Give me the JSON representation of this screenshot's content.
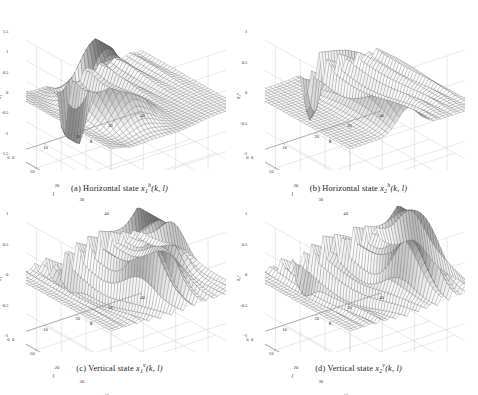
{
  "figure": {
    "title_visible": false,
    "background": "#ffffff",
    "layout": "2x2 grid of 3D mesh surface plots",
    "mesh_color": "#4a4a4a",
    "grid_color": "#c8c8c8",
    "axis_color": "#808080"
  },
  "panels": [
    {
      "id": "a",
      "caption_prefix": "(a)",
      "caption_text": "Horizontal state",
      "var_base": "x",
      "var_sub": "1",
      "var_sup": "h",
      "var_args": "(k, l)",
      "zlabel": "x₁ʰ",
      "zticks": [
        "1.5",
        "1",
        "0.5",
        "0",
        "-0.5",
        "-1",
        "-1.5"
      ],
      "kticks": [
        "0",
        "10",
        "20",
        "30",
        "40"
      ],
      "lticks": [
        "0",
        "10",
        "20",
        "30",
        "40"
      ],
      "klabel": "k",
      "llabel": "l"
    },
    {
      "id": "b",
      "caption_prefix": "(b)",
      "caption_text": "Horizontal state",
      "var_base": "x",
      "var_sub": "2",
      "var_sup": "h",
      "var_args": "(k, l)",
      "zlabel": "x₂ʰ",
      "zticks": [
        "1",
        "0.5",
        "0",
        "-0.5",
        "-1"
      ],
      "kticks": [
        "0",
        "10",
        "20",
        "30",
        "40"
      ],
      "lticks": [
        "0",
        "10",
        "20",
        "30",
        "40"
      ],
      "klabel": "k",
      "llabel": "l"
    },
    {
      "id": "c",
      "caption_prefix": "(c)",
      "caption_text": "Vertical state",
      "var_base": "x",
      "var_sub": "1",
      "var_sup": "v",
      "var_args": "(k, l)",
      "zlabel": "x₁ᵛ",
      "zticks": [
        "1",
        "0.5",
        "0",
        "-0.5",
        "-1"
      ],
      "kticks": [
        "0",
        "10",
        "20",
        "30",
        "40"
      ],
      "lticks": [
        "0",
        "10",
        "20",
        "30",
        "40"
      ],
      "klabel": "k",
      "llabel": "l"
    },
    {
      "id": "d",
      "caption_prefix": "(d)",
      "caption_text": "Vertical state",
      "var_base": "x",
      "var_sub": "2",
      "var_sup": "v",
      "var_args": "(k, l)",
      "zlabel": "x₂ᵛ",
      "zticks": [
        "1",
        "0.5",
        "0",
        "-0.5",
        "-1"
      ],
      "kticks": [
        "0",
        "10",
        "20",
        "30",
        "40"
      ],
      "lticks": [
        "0",
        "10",
        "20",
        "30",
        "40"
      ],
      "klabel": "k",
      "llabel": "l"
    }
  ],
  "chart_data": [
    {
      "type": "surface",
      "panel": "a",
      "title": "(a) Horizontal state x_1^h(k,l)",
      "xlabel": "k",
      "ylabel": "l",
      "zlabel": "x_1^h",
      "xlim": [
        0,
        40
      ],
      "ylim": [
        0,
        40
      ],
      "zlim": [
        -1.5,
        1.5
      ],
      "xticks": [
        0,
        10,
        20,
        30,
        40
      ],
      "yticks": [
        0,
        10,
        20,
        30,
        40
      ],
      "zticks": [
        -1.5,
        -1,
        -0.5,
        0,
        0.5,
        1,
        1.5
      ],
      "grid": true,
      "mesh_n": 41,
      "description": "Damped oscillatory 2D wave: broad central dome peaking near z=1.4 around (k=14,l=20), with a deep negative trough near z=-1.5 at the k~16 front edge and secondary decaying ripple ridges toward larger k.",
      "model": {
        "kind": "ripple-decay",
        "peak_value": 1.45,
        "trough_value": -1.5,
        "peak_at": [
          14,
          20
        ],
        "ripple_wavelength": 4.5,
        "decay_k": 0.11,
        "decay_l": 0.06
      }
    },
    {
      "type": "surface",
      "panel": "b",
      "title": "(b) Horizontal state x_2^h(k,l)",
      "xlabel": "k",
      "ylabel": "l",
      "zlabel": "x_2^h",
      "xlim": [
        0,
        40
      ],
      "ylim": [
        0,
        40
      ],
      "zlim": [
        -1,
        1
      ],
      "xticks": [
        0,
        10,
        20,
        30,
        40
      ],
      "yticks": [
        0,
        10,
        20,
        30,
        40
      ],
      "zticks": [
        -1,
        -0.5,
        0,
        0.5,
        1
      ],
      "grid": true,
      "mesh_n": 41,
      "description": "Flat plateau near zero for small k, rising to a rounded ridge of about z=0.75 near k=18, with a very sharp narrow dark negative spike reaching z=-1 at approximately k=17 on the near edge, followed by high-frequency decaying oscillations for k>20.",
      "model": {
        "kind": "spike-ripple",
        "peak_value": 0.78,
        "spike_value": -1.0,
        "spike_at": [
          17,
          2
        ],
        "ripple_wavelength": 3.0,
        "decay_k": 0.09
      }
    },
    {
      "type": "surface",
      "panel": "c",
      "title": "(c) Vertical state x_1^v(k,l)",
      "xlabel": "k",
      "ylabel": "l",
      "zlabel": "x_1^v",
      "xlim": [
        0,
        40
      ],
      "ylim": [
        0,
        40
      ],
      "zlim": [
        -1,
        1
      ],
      "xticks": [
        0,
        10,
        20,
        30,
        40
      ],
      "yticks": [
        0,
        10,
        20,
        30,
        40
      ],
      "zticks": [
        -1,
        -0.5,
        0,
        0.5,
        1
      ],
      "grid": true,
      "mesh_n": 41,
      "description": "Corrugated surface of parallel oscillating ridges running along l, amplitude growing with k to a dominant peak of about z=1 near (k=27,l=22), with a smaller secondary peak near k=36 and a flat near-zero region for k<8.",
      "model": {
        "kind": "growing-ridges",
        "peak_value": 1.0,
        "peak_at": [
          27,
          22
        ],
        "second_peak_at": [
          36,
          16
        ],
        "second_peak_value": 0.6,
        "ripple_wavelength": 3.4,
        "decay_k": 0.05
      }
    },
    {
      "type": "surface",
      "panel": "d",
      "title": "(d) Vertical state x_2^v(k,l)",
      "xlabel": "k",
      "ylabel": "l",
      "zlabel": "x_2^v",
      "xlim": [
        0,
        40
      ],
      "ylim": [
        0,
        40
      ],
      "zlim": [
        -1,
        1
      ],
      "xticks": [
        0,
        10,
        20,
        30,
        40
      ],
      "yticks": [
        0,
        10,
        20,
        30,
        40
      ],
      "zticks": [
        -1,
        -0.5,
        0,
        0.5,
        1
      ],
      "grid": true,
      "mesh_n": 41,
      "description": "Similar corrugated ridge field to panel (c) but with the dominant dark peak shifted toward larger k near (k=32,l=24) reaching about z=1, dense oscillations in the mid range and a flat near-zero plateau for small k.",
      "model": {
        "kind": "growing-ridges",
        "peak_value": 1.0,
        "peak_at": [
          32,
          24
        ],
        "second_peak_at": [
          38,
          14
        ],
        "second_peak_value": 0.55,
        "ripple_wavelength": 3.2,
        "decay_k": 0.045
      }
    }
  ]
}
